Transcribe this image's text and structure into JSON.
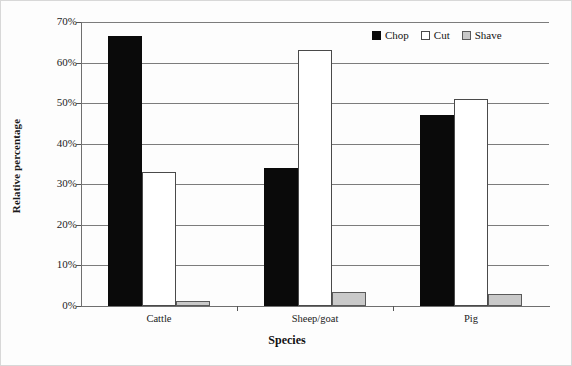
{
  "chart_data": {
    "type": "bar",
    "title": "",
    "xlabel": "Species",
    "ylabel": "Relative percentage",
    "categories": [
      "Cattle",
      "Sheep/goat",
      "Pig"
    ],
    "series": [
      {
        "name": "Chop",
        "color": "#0a0a0a",
        "values": [
          66.5,
          34.0,
          47.0
        ]
      },
      {
        "name": "Cut",
        "color": "#ffffff",
        "values": [
          33.0,
          63.0,
          51.0
        ]
      },
      {
        "name": "Shave",
        "color": "#c9c9c9",
        "values": [
          1.2,
          3.5,
          3.0
        ]
      }
    ],
    "ylim": [
      0,
      70
    ],
    "ytick_labels": [
      "0%",
      "10%",
      "20%",
      "30%",
      "40%",
      "50%",
      "60%",
      "70%"
    ],
    "ytick_values": [
      0,
      10,
      20,
      30,
      40,
      50,
      60,
      70
    ],
    "grid": true,
    "legend_position": "top-right"
  }
}
